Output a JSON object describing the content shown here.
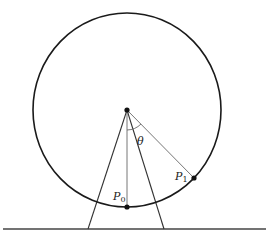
{
  "diagram": {
    "center": {
      "x": 127,
      "y": 110
    },
    "circle": {
      "rx": 94,
      "ry": 97
    },
    "points": {
      "p0": {
        "label": "P",
        "sub": "0",
        "x": 127,
        "y": 207
      },
      "p1": {
        "label": "P",
        "sub": "1",
        "x": 194,
        "y": 178
      }
    },
    "angle_label": "θ",
    "ground": {
      "x1": 3,
      "x2": 266,
      "y": 229
    },
    "legs": [
      {
        "x": 88
      },
      {
        "x": 164
      }
    ],
    "colors": {
      "stroke": "#1a1a1a",
      "thin": "#555555"
    }
  }
}
